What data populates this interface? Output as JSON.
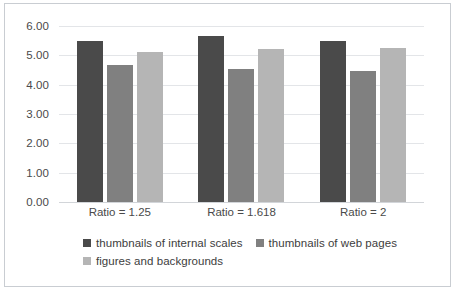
{
  "chart_data": {
    "type": "bar",
    "title": "",
    "xlabel": "",
    "ylabel": "",
    "categories": [
      "Ratio = 1.25",
      "Ratio = 1.618",
      "Ratio = 2"
    ],
    "series": [
      {
        "name": "thumbnails of internal scales",
        "color": "#4a4a4a",
        "values": [
          5.5,
          5.65,
          5.48
        ]
      },
      {
        "name": "thumbnails of web pages",
        "color": "#808080",
        "values": [
          4.68,
          4.52,
          4.45
        ]
      },
      {
        "name": "figures and backgrounds",
        "color": "#b5b5b5",
        "values": [
          5.12,
          5.22,
          5.25
        ]
      }
    ],
    "ylim": [
      0,
      6
    ],
    "ytick_labels": [
      "6.00",
      "5.00",
      "4.00",
      "3.00",
      "2.00",
      "1.00",
      "0.00"
    ],
    "ytick_values": [
      6,
      5,
      4,
      3,
      2,
      1,
      0
    ],
    "grid": true,
    "legend_position": "bottom"
  }
}
